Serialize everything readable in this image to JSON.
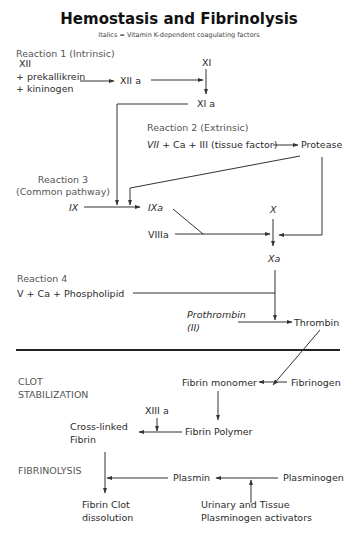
{
  "title": "Hemostasis and Fibrinolysis",
  "subtitle": "Italics = Vitamin K-dependent coagulating factors",
  "reaction1": {
    "label": "Reaction 1 (Intrinsic)",
    "xii": "XII",
    "prekallikrein": "+ prekallikrein",
    "kininogen": "+ kininogen",
    "xiia": "XII a",
    "xi": "XI",
    "xia": "XI a"
  },
  "reaction2": {
    "label": "Reaction 2 (Extrinsic)",
    "vii": "VII",
    "formula_rest": " + Ca + III (tissue factor)",
    "protease": "Protease"
  },
  "reaction3": {
    "label_line1": "Reaction 3",
    "label_line2": "(Common pathway)",
    "ix": "IX",
    "ixa": "IXa",
    "viiia": "VIIIa",
    "x": "X",
    "xa": "Xa"
  },
  "reaction4": {
    "label": "Reaction 4",
    "formula": "V + Ca + Phospholipid",
    "prothrombin": "Prothrombin",
    "prothrombin_code": "(II)",
    "thrombin": "Thrombin"
  },
  "clot_stabilization": {
    "label_line1": "CLOT",
    "label_line2": "STABILIZATION",
    "fibrin_monomer": "Fibrin monomer",
    "fibrinogen": "Fibrinogen",
    "fibrin_polymer": "Fibrin Polymer",
    "xiiia": "XIII a",
    "cross_linked_line1": "Cross-linked",
    "cross_linked_line2": "Fibrin"
  },
  "fibrinolysis": {
    "label": "FIBRINOLYSIS",
    "plasmin": "Plasmin",
    "plasminogen": "Plasminogen",
    "clot_dissolution_line1": "Fibrin Clot",
    "clot_dissolution_line2": "dissolution",
    "activators_line1": "Urinary and Tissue",
    "activators_line2": "Plasminogen activators"
  }
}
